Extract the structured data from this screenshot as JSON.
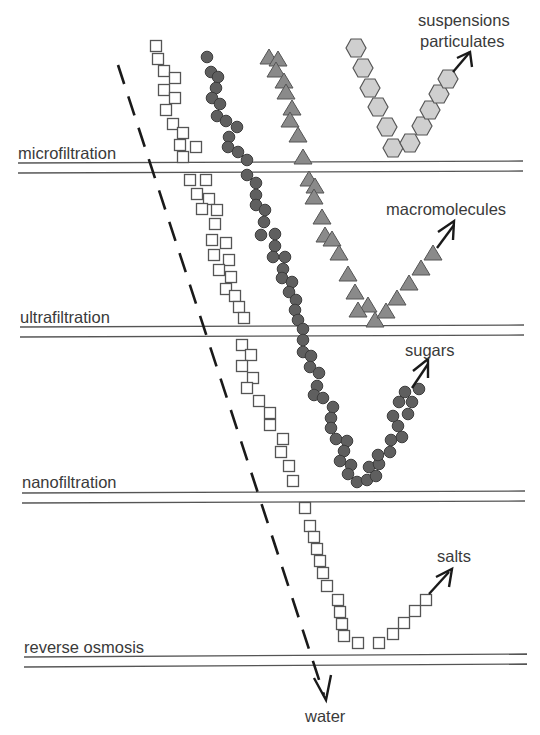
{
  "diagram": {
    "membranes": [
      {
        "label": "microfiltration",
        "label_x": 18,
        "label_y": 159,
        "y1": 163,
        "y2": 172
      },
      {
        "label": "ultrafiltration",
        "label_x": 20,
        "label_y": 323,
        "y1": 326,
        "y2": 336
      },
      {
        "label": "nanofiltration",
        "label_x": 22,
        "label_y": 488,
        "y1": 492,
        "y2": 502
      },
      {
        "label": "reverse osmosis",
        "label_x": 24,
        "label_y": 653,
        "y1": 656,
        "y2": 666
      }
    ],
    "species": [
      {
        "name": "suspensions particulates",
        "label_lines": [
          "suspensions",
          "particulates"
        ],
        "marker": "hexagon",
        "retained_by": "microfiltration"
      },
      {
        "name": "macromolecules",
        "label_lines": [
          "macromolecules"
        ],
        "marker": "triangle",
        "retained_by": "ultrafiltration"
      },
      {
        "name": "sugars",
        "label_lines": [
          "sugars"
        ],
        "marker": "circle",
        "retained_by": "nanofiltration"
      },
      {
        "name": "salts",
        "label_lines": [
          "salts"
        ],
        "marker": "square",
        "retained_by": "reverse osmosis"
      }
    ],
    "permeate": {
      "label": "water",
      "style": "dashed arrow"
    },
    "colors": {
      "background": "#ffffff",
      "line": "#555555",
      "text": "#3a3a3a",
      "circle_fill": "#5f5f5f",
      "triangle_fill": "#8a8a8a",
      "hexagon_fill": "#cfcfcf",
      "square_fill": "#ffffff"
    }
  },
  "labels": {
    "microfiltration": "microfiltration",
    "ultrafiltration": "ultrafiltration",
    "nanofiltration": "nanofiltration",
    "reverse_osmosis": "reverse osmosis",
    "suspensions": "suspensions",
    "particulates": "particulates",
    "macromolecules": "macromolecules",
    "sugars": "sugars",
    "salts": "salts",
    "water": "water"
  }
}
